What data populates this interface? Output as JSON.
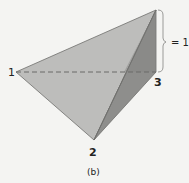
{
  "figure": {
    "caption": "(b)",
    "vertices": {
      "v1": {
        "label": "1"
      },
      "v2": {
        "label": "2"
      },
      "v3": {
        "label": "3"
      }
    },
    "brace_label": "= 1",
    "colors": {
      "background": "#f4f4f2",
      "front_face": "#bdbdbb",
      "side_face": "#8e8e8c",
      "edge": "#6e6e6c",
      "dashed_edge": "#6a6a68",
      "brace": "#9a9a98"
    }
  }
}
